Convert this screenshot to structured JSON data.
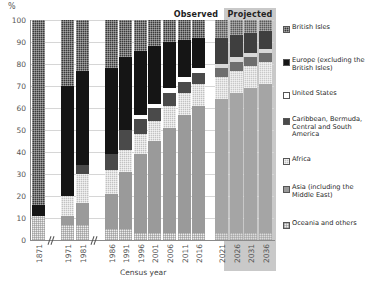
{
  "axis": {
    "y_unit": "%",
    "y_ticks": [
      "0",
      "10",
      "20",
      "30",
      "40",
      "50",
      "60",
      "70",
      "80",
      "90",
      "100"
    ],
    "x_title": "Census year"
  },
  "banners": {
    "observed": "Observed",
    "projected": "Projected"
  },
  "legend": {
    "items": [
      {
        "label": "British Isles",
        "swatch": "dark-checked"
      },
      {
        "label": "Europe (excluding the British Isles)",
        "swatch": "black"
      },
      {
        "label": "United States",
        "swatch": "white"
      },
      {
        "label": "Caribbean, Bermuda, Central and South America",
        "swatch": "dark-grey"
      },
      {
        "label": "Africa",
        "swatch": "light-checked"
      },
      {
        "label": "Asia (including the Middle East)",
        "swatch": "mid-grey"
      },
      {
        "label": "Oceania and others",
        "swatch": "pale-checked"
      }
    ]
  },
  "chart_data": {
    "type": "bar",
    "subtype": "stacked-percentage",
    "title": "",
    "xlabel": "Census year",
    "ylabel": "%",
    "ylim": [
      0,
      100
    ],
    "grid": true,
    "legend_position": "right",
    "axis_breaks_after": [
      "1871",
      "1981"
    ],
    "categories": [
      "1871",
      "1971",
      "1981",
      "1986",
      "1991",
      "1996",
      "2001",
      "2006",
      "2011",
      "2016",
      "2021",
      "2026",
      "2031",
      "2036"
    ],
    "status": [
      "observed",
      "observed",
      "observed",
      "observed",
      "observed",
      "observed",
      "observed",
      "observed",
      "observed",
      "observed",
      "projected",
      "projected",
      "projected",
      "projected"
    ],
    "series": [
      {
        "name": "British Isles",
        "values": [
          84,
          30,
          23,
          22,
          17,
          14,
          12,
          10,
          9,
          8,
          8,
          7,
          6,
          5
        ]
      },
      {
        "name": "Europe (excluding the British Isles)",
        "values": [
          5,
          50,
          43,
          39,
          33,
          29,
          26,
          21,
          17,
          14,
          12,
          10,
          9,
          8
        ]
      },
      {
        "name": "United States",
        "values": [
          0,
          0,
          0,
          0,
          0,
          2,
          2,
          2,
          2,
          2,
          2,
          2,
          2,
          2
        ]
      },
      {
        "name": "Caribbean, Bermuda, Central and South America",
        "values": [
          0,
          0,
          4,
          7,
          9,
          7,
          6,
          6,
          5,
          5,
          4,
          4,
          4,
          4
        ]
      },
      {
        "name": "Africa",
        "values": [
          0,
          9,
          13,
          11,
          10,
          9,
          9,
          10,
          10,
          10,
          10,
          10,
          10,
          10
        ]
      },
      {
        "name": "Asia (including the Middle East)",
        "values": [
          0,
          4,
          10,
          16,
          26,
          36,
          42,
          48,
          54,
          58,
          61,
          64,
          66,
          68
        ]
      },
      {
        "name": "Oceania and others",
        "values": [
          11,
          7,
          7,
          5,
          5,
          3,
          3,
          3,
          3,
          3,
          3,
          3,
          3,
          3
        ]
      }
    ]
  }
}
